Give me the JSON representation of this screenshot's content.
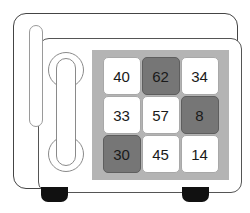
{
  "device": {
    "name": "safe",
    "body_color": "#ffffff",
    "outline_color": "#444444",
    "foot_color": "#111111"
  },
  "handle": {
    "name": "door-handle",
    "outline_color": "#8a8a8a"
  },
  "keypad": {
    "panel_color": "#b4b4b4",
    "light_key_color": "#ffffff",
    "dark_key_color": "#767676",
    "key_text_color": "#1a1a1a",
    "rows": [
      [
        {
          "label": "40",
          "state": "light"
        },
        {
          "label": "62",
          "state": "dark"
        },
        {
          "label": "34",
          "state": "light"
        }
      ],
      [
        {
          "label": "33",
          "state": "light"
        },
        {
          "label": "57",
          "state": "light"
        },
        {
          "label": "8",
          "state": "dark"
        }
      ],
      [
        {
          "label": "30",
          "state": "dark"
        },
        {
          "label": "45",
          "state": "light"
        },
        {
          "label": "14",
          "state": "light"
        }
      ]
    ]
  },
  "feet": [
    {
      "name": "foot-left"
    },
    {
      "name": "foot-right"
    }
  ]
}
